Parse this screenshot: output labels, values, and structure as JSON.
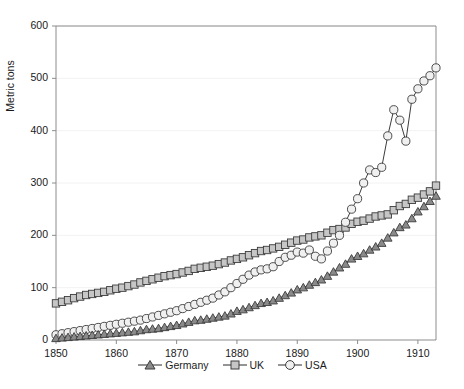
{
  "chart_data": {
    "type": "line",
    "title": "",
    "subtitle": "",
    "xlabel": "",
    "ylabel": "Metric tons",
    "xlim": [
      1850,
      1913
    ],
    "ylim": [
      0,
      600
    ],
    "xticks": [
      1850,
      1860,
      1870,
      1880,
      1890,
      1900,
      1910
    ],
    "yticks": [
      0,
      100,
      200,
      300,
      400,
      500,
      600
    ],
    "grid": "horizontal-major-faint",
    "legend_position": "bottom-center",
    "x": [
      1850,
      1851,
      1852,
      1853,
      1854,
      1855,
      1856,
      1857,
      1858,
      1859,
      1860,
      1861,
      1862,
      1863,
      1864,
      1865,
      1866,
      1867,
      1868,
      1869,
      1870,
      1871,
      1872,
      1873,
      1874,
      1875,
      1876,
      1877,
      1878,
      1879,
      1880,
      1881,
      1882,
      1883,
      1884,
      1885,
      1886,
      1887,
      1888,
      1889,
      1890,
      1891,
      1892,
      1893,
      1894,
      1895,
      1896,
      1897,
      1898,
      1899,
      1900,
      1901,
      1902,
      1903,
      1904,
      1905,
      1906,
      1907,
      1908,
      1909,
      1910,
      1911,
      1912,
      1913
    ],
    "series": [
      {
        "name": "Germany",
        "marker": "triangle",
        "marker_color": "#8a8a8a",
        "line_color": "#3c3c3c",
        "values": [
          3,
          4,
          5,
          6,
          7,
          8,
          9,
          10,
          11,
          12,
          13,
          14,
          15,
          16,
          18,
          20,
          21,
          22,
          24,
          26,
          28,
          31,
          34,
          37,
          38,
          40,
          42,
          44,
          46,
          50,
          55,
          58,
          62,
          66,
          70,
          72,
          75,
          80,
          85,
          90,
          96,
          100,
          105,
          110,
          115,
          122,
          130,
          138,
          145,
          155,
          160,
          165,
          172,
          178,
          185,
          195,
          205,
          215,
          220,
          232,
          245,
          255,
          265,
          275
        ]
      },
      {
        "name": "UK",
        "marker": "square",
        "marker_color": "#c6c6c6",
        "line_color": "#3c3c3c",
        "values": [
          70,
          73,
          76,
          80,
          83,
          86,
          88,
          90,
          92,
          95,
          98,
          100,
          103,
          106,
          110,
          113,
          116,
          119,
          122,
          124,
          126,
          129,
          132,
          136,
          138,
          140,
          142,
          145,
          148,
          152,
          155,
          158,
          162,
          166,
          170,
          172,
          175,
          178,
          182,
          186,
          190,
          192,
          196,
          198,
          200,
          205,
          210,
          212,
          215,
          222,
          226,
          228,
          232,
          236,
          238,
          240,
          248,
          256,
          260,
          268,
          272,
          278,
          284,
          295
        ]
      },
      {
        "name": "USA",
        "marker": "circle",
        "marker_color": "#f0f0f0",
        "line_color": "#3c3c3c",
        "values": [
          10,
          12,
          14,
          16,
          18,
          20,
          22,
          24,
          26,
          28,
          30,
          32,
          34,
          36,
          38,
          41,
          44,
          47,
          50,
          53,
          56,
          60,
          64,
          68,
          72,
          76,
          80,
          86,
          92,
          100,
          108,
          116,
          124,
          130,
          134,
          136,
          140,
          150,
          158,
          162,
          168,
          166,
          172,
          160,
          155,
          170,
          185,
          200,
          225,
          250,
          270,
          300,
          325,
          320,
          330,
          390,
          440,
          420,
          380,
          460,
          480,
          495,
          505,
          520
        ]
      }
    ]
  },
  "legend": {
    "entries": [
      {
        "label": "Germany"
      },
      {
        "label": "UK"
      },
      {
        "label": "USA"
      }
    ]
  }
}
